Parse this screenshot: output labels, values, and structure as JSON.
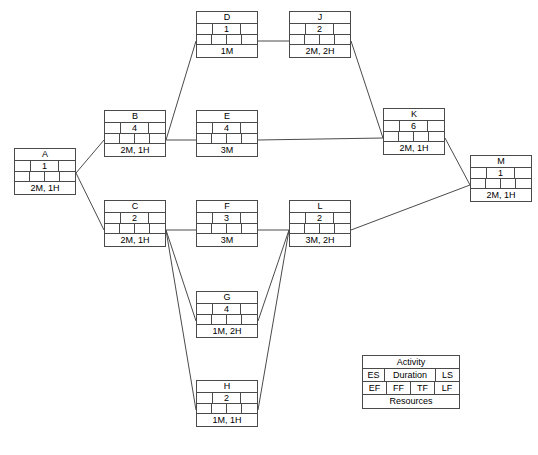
{
  "diagram": {
    "line_color": "#4a4a4a",
    "background": "#ffffff"
  },
  "legend": {
    "name": "Activity",
    "es": "ES",
    "duration": "Duration",
    "ls": "LS",
    "ef": "EF",
    "ff": "FF",
    "tf": "TF",
    "lf": "LF",
    "resources": "Resources"
  },
  "nodes": [
    {
      "id": "A",
      "name": "A",
      "duration": "1",
      "resources": "2M, 1H",
      "x": 14,
      "y": 148
    },
    {
      "id": "B",
      "name": "B",
      "duration": "4",
      "resources": "2M, 1H",
      "x": 104,
      "y": 110
    },
    {
      "id": "C",
      "name": "C",
      "duration": "2",
      "resources": "2M, 1H",
      "x": 104,
      "y": 200
    },
    {
      "id": "D",
      "name": "D",
      "duration": "1",
      "resources": "1M",
      "x": 196,
      "y": 11
    },
    {
      "id": "E",
      "name": "E",
      "duration": "4",
      "resources": "3M",
      "x": 196,
      "y": 110
    },
    {
      "id": "F",
      "name": "F",
      "duration": "3",
      "resources": "3M",
      "x": 196,
      "y": 200
    },
    {
      "id": "G",
      "name": "G",
      "duration": "4",
      "resources": "1M, 2H",
      "x": 196,
      "y": 291
    },
    {
      "id": "H",
      "name": "H",
      "duration": "2",
      "resources": "1M, 1H",
      "x": 196,
      "y": 380
    },
    {
      "id": "J",
      "name": "J",
      "duration": "2",
      "resources": "2M, 2H",
      "x": 289,
      "y": 11
    },
    {
      "id": "K",
      "name": "K",
      "duration": "6",
      "resources": "2M, 1H",
      "x": 383,
      "y": 108
    },
    {
      "id": "L",
      "name": "L",
      "duration": "2",
      "resources": "3M, 2H",
      "x": 289,
      "y": 200
    },
    {
      "id": "M",
      "name": "M",
      "duration": "1",
      "resources": "2M, 1H",
      "x": 470,
      "y": 155
    }
  ],
  "edges": [
    {
      "from": "A",
      "to": "B",
      "points": "76,173 104,140"
    },
    {
      "from": "A",
      "to": "C",
      "points": "76,173 104,230"
    },
    {
      "from": "B",
      "to": "D",
      "points": "166,140 196,41"
    },
    {
      "from": "B",
      "to": "E",
      "points": "166,140 196,140"
    },
    {
      "from": "D",
      "to": "J",
      "points": "258,41 289,41"
    },
    {
      "from": "J",
      "to": "K",
      "points": "351,41 383,138"
    },
    {
      "from": "E",
      "to": "K",
      "points": "258,140 383,138"
    },
    {
      "from": "C",
      "to": "F",
      "points": "166,230 196,230"
    },
    {
      "from": "C",
      "to": "G",
      "points": "166,230 196,321"
    },
    {
      "from": "C",
      "to": "H",
      "points": "166,230 196,410"
    },
    {
      "from": "F",
      "to": "L",
      "points": "258,230 289,230"
    },
    {
      "from": "G",
      "to": "L",
      "points": "258,321 289,230"
    },
    {
      "from": "H",
      "to": "L",
      "points": "258,410 289,230"
    },
    {
      "from": "K",
      "to": "M",
      "points": "445,138 470,185"
    },
    {
      "from": "L",
      "to": "M",
      "points": "351,230 470,185"
    }
  ]
}
